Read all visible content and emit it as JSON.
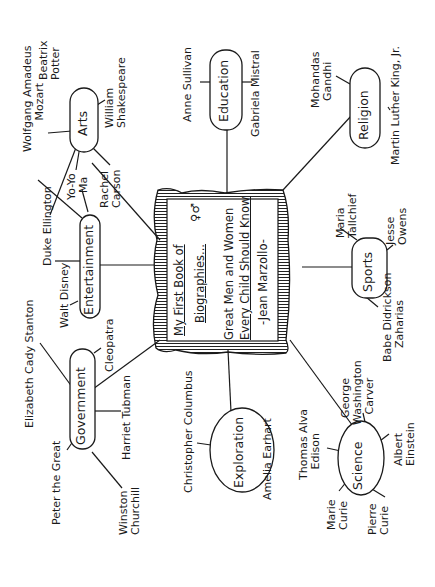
{
  "center": {
    "line1": "My First Book of",
    "line2": "Biographies...",
    "line3": "Great Men and Women",
    "line4": "Every Child Should Know",
    "line5": "-Jean Marzollo-",
    "symbol": "♀♂"
  },
  "categories": {
    "arts": {
      "label": "Arts",
      "people": [
        "Beatrix Potter",
        "Wolfgang Amadeus Mozart",
        "William Shakespeare",
        "Yo-Yo Ma",
        "Rachel Carson"
      ]
    },
    "education": {
      "label": "Education",
      "people": [
        "Anne Sullivan",
        "Gabriela Mistral"
      ]
    },
    "religion": {
      "label": "Religion",
      "people": [
        "Mohandas Gandhi",
        "Martin Luther King, Jr."
      ]
    },
    "entertainment": {
      "label": "Entertainment",
      "people": [
        "Duke Ellington",
        "Walt Disney"
      ]
    },
    "sports": {
      "label": "Sports",
      "people": [
        "Maria Tallchief",
        "Jesse Owens",
        "Babe Didrickson Zaharias"
      ]
    },
    "government": {
      "label": "Government",
      "people": [
        "Elizabeth Cady Stanton",
        "Cleopatra",
        "Peter the Great",
        "Harriet Tubman",
        "Winston Churchill"
      ]
    },
    "exploration": {
      "label": "Exploration",
      "people": [
        "Christopher Columbus",
        "Amelia Earhart"
      ]
    },
    "science": {
      "label": "Science",
      "people": [
        "George Washington Carver",
        "Thomas Alva Edison",
        "Albert Einstein",
        "Marie Curie",
        "Pierre Curie"
      ]
    }
  },
  "labels": {
    "beatrix": "Beatrix\nPotter",
    "mozart": "Wolfgang Amadeus\n         Mozart",
    "shakespeare": "William\nShakespeare",
    "yoyoma": "Yo-Yo\n  Ma",
    "carson": "Rachel\nCarson",
    "sullivan": "Anne Sullivan",
    "mistral": "Gabriela Mistral",
    "gandhi": "Mohandas\n  Gandhi",
    "mlk": "Martin Luther King, Jr.",
    "ellington": "Duke Ellington",
    "disney": "Walt Disney",
    "tallchief": "Maria\nTallchief",
    "owens": "Jesse\nOwens",
    "zaharias": "Babe Didrickson\n    Zaharias",
    "stanton": "Elizabeth Cady Stanton",
    "cleopatra": "Cleopatra",
    "peter": "Peter the Great",
    "tubman": "Harriet Tubman",
    "churchill": "Winston\nChurchill",
    "columbus": "Christopher Columbus",
    "earhart": "Amelia Earhart",
    "carver": "  George\nWashington\n   Carver",
    "edison": "Thomas Alva\n   Edison",
    "einstein": "Albert\nEinstein",
    "mcurie": "Marie\nCurie",
    "pcurie": "Pierre\nCurie"
  }
}
